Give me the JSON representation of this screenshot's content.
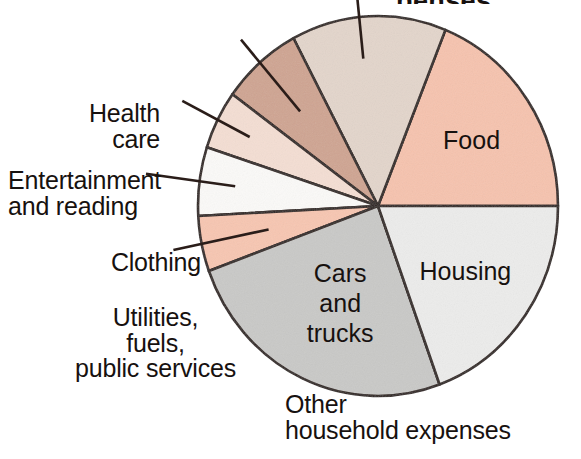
{
  "figure": {
    "title_partial": "penses",
    "title_visible": false,
    "background_color": "#ffffff",
    "outline_color": "#2a1d19"
  },
  "chart_data": {
    "type": "pie",
    "title": "",
    "xlabel": "",
    "ylabel": "",
    "legend_position": "none",
    "grid": false,
    "labels_inside": [
      "Cars and trucks",
      "Housing",
      "Food"
    ],
    "labels_outside": [
      "Health care",
      "Entertainment and reading",
      "Clothing",
      "Utilities, fuels, public services",
      "Other household expenses"
    ],
    "categories": [
      "Food",
      "Other household expenses",
      "Utilities, fuels, public services",
      "Clothing",
      "Entertainment and reading",
      "Health care",
      "Cars and trucks",
      "Housing"
    ],
    "values": [
      19,
      14,
      7,
      5,
      6,
      5,
      25,
      19
    ],
    "units": "percent",
    "slices": [
      {
        "name": "Food",
        "label": "Food",
        "value": 19,
        "color": "#f6c3ae",
        "start_angle": 0,
        "end_angle": 68,
        "label_placement": "inside"
      },
      {
        "name": "Other household expenses",
        "label": "Other\nhousehold expenses",
        "value": 14,
        "color": "#e3d5cb",
        "start_angle": 68,
        "end_angle": 118,
        "label_placement": "outside"
      },
      {
        "name": "Utilities, fuels, public services",
        "label": "Utilities,\nfuels,\npublic services",
        "value": 7,
        "color": "#cfa491",
        "start_angle": 118,
        "end_angle": 144,
        "label_placement": "outside"
      },
      {
        "name": "Clothing",
        "label": "Clothing",
        "value": 5,
        "color": "#f4ded3",
        "start_angle": 144,
        "end_angle": 162,
        "label_placement": "outside"
      },
      {
        "name": "Entertainment and reading",
        "label": "Entertainment\nand reading",
        "value": 6,
        "color": "#fbfaf8",
        "start_angle": 162,
        "end_angle": 183,
        "label_placement": "outside"
      },
      {
        "name": "Health care",
        "label": "Health\ncare",
        "value": 5,
        "color": "#f7c6b1",
        "start_angle": 183,
        "end_angle": 200,
        "label_placement": "outside"
      },
      {
        "name": "Cars and trucks",
        "label": "Cars\nand\ntrucks",
        "value": 25,
        "color": "#c9c9c7",
        "start_angle": 200,
        "end_angle": 290,
        "label_placement": "inside"
      },
      {
        "name": "Housing",
        "label": "Housing",
        "value": 19,
        "color": "#ececeb",
        "start_angle": 290,
        "end_angle": 360,
        "label_placement": "inside"
      }
    ]
  },
  "labels": {
    "cars_and_trucks": {
      "line1": "Cars",
      "line2": "and",
      "line3": "trucks"
    },
    "housing": {
      "line1": "Housing"
    },
    "food": {
      "line1": "Food"
    },
    "health_care": {
      "line1": "Health",
      "line2": "care"
    },
    "entertainment": {
      "line1": "Entertainment",
      "line2": "and reading"
    },
    "clothing": {
      "line1": "Clothing"
    },
    "utilities": {
      "line1": "Utilities,",
      "line2": "fuels,",
      "line3": "public services"
    },
    "other_household": {
      "line1": "Other",
      "line2": "household expenses"
    }
  }
}
